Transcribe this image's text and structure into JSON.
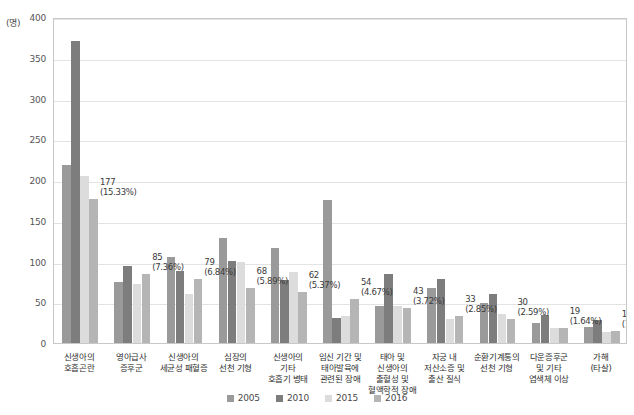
{
  "chart_data": {
    "type": "bar",
    "title": "",
    "subtitle": "",
    "xlabel": "",
    "ylabel": "",
    "unit_label": "(명)",
    "ylim": [
      0,
      400
    ],
    "yticks": [
      0,
      50,
      100,
      150,
      200,
      250,
      300,
      350,
      400
    ],
    "ytick_labels": [
      "0",
      "50",
      "100",
      "150",
      "200",
      "250",
      "300",
      "350",
      "400"
    ],
    "grid": true,
    "legend_position": "bottom",
    "categories": [
      "신생아의\n호흡곤란",
      "영아급사\n증후군",
      "신생아의\n세균성 패혈증",
      "심장의\n선천 기형",
      "신생아의\n기타\n호흡기 병태",
      "임신 기간 및\n태아발육에\n관련된 장애",
      "태아 및\n신생아의\n출혈성 및\n혈액학적 장애",
      "자궁 내\n저산소증 및\n출산 질식",
      "순환기계통의\n선천 기형",
      "다운증후군\n및 기타\n염색체 이상",
      "가해\n(타살)"
    ],
    "series": [
      {
        "name": "2005",
        "color": "#9a9a9a",
        "values": [
          219,
          75,
          105,
          129,
          116,
          175,
          46,
          67,
          49,
          24,
          20
        ]
      },
      {
        "name": "2010",
        "color": "#7d7d7d",
        "values": [
          370,
          94,
          88,
          101,
          77,
          31,
          85,
          79,
          60,
          34,
          28
        ]
      },
      {
        "name": "2015",
        "color": "#dcdcdc",
        "values": [
          205,
          72,
          60,
          99,
          87,
          33,
          46,
          29,
          35,
          19,
          14
        ]
      },
      {
        "name": "2016",
        "color": "#b5b5b5",
        "values": [
          177,
          85,
          79,
          68,
          62,
          54,
          43,
          33,
          30,
          19,
          15
        ]
      }
    ],
    "point_labels": [
      {
        "value": "177",
        "percent": "(15.33%)"
      },
      {
        "value": "85",
        "percent": "(7.36%)"
      },
      {
        "value": "79",
        "percent": "(6.84%)"
      },
      {
        "value": "68",
        "percent": "(5.89%)"
      },
      {
        "value": "62",
        "percent": "(5.37%)"
      },
      {
        "value": "54",
        "percent": "(4.67%)"
      },
      {
        "value": "43",
        "percent": "(3.72%)"
      },
      {
        "value": "33",
        "percent": "(2.85%)"
      },
      {
        "value": "30",
        "percent": "(2.59%)"
      },
      {
        "value": "19",
        "percent": "(1.64%)"
      },
      {
        "value": "15",
        "percent": "(1.29%)"
      }
    ]
  }
}
